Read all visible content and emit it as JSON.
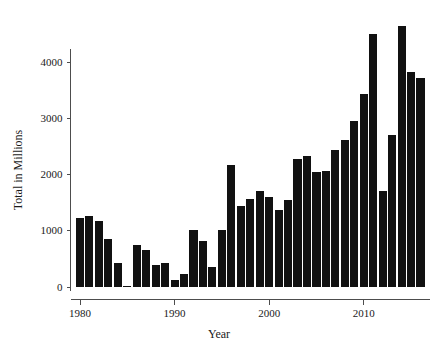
{
  "chart_data": {
    "type": "bar",
    "title": "",
    "xlabel": "Year",
    "ylabel": "Total in Millions",
    "categories": [
      1980,
      1981,
      1982,
      1983,
      1984,
      1985,
      1986,
      1987,
      1988,
      1989,
      1990,
      1991,
      1992,
      1993,
      1994,
      1995,
      1996,
      1997,
      1998,
      1999,
      2000,
      2001,
      2002,
      2003,
      2004,
      2005,
      2006,
      2007,
      2008,
      2009,
      2010,
      2011,
      2012,
      2013,
      2014,
      2015,
      2016
    ],
    "values": [
      1230,
      1265,
      1175,
      860,
      430,
      15,
      740,
      660,
      385,
      430,
      120,
      230,
      1020,
      810,
      360,
      1015,
      2165,
      1440,
      1560,
      1710,
      1600,
      1375,
      1545,
      2280,
      2335,
      2040,
      2060,
      2430,
      2610,
      2950,
      3430,
      4500,
      1710,
      2700,
      4640,
      3820,
      3720
    ],
    "xlim": [
      1979,
      2017
    ],
    "ylim": [
      0,
      4800
    ],
    "xticks": [
      1980,
      1990,
      2000,
      2010
    ],
    "xtick_labels": [
      "1980",
      "1990",
      "2000",
      "2010"
    ],
    "yticks": [
      0,
      1000,
      2000,
      3000,
      4000
    ],
    "ytick_labels": [
      "0",
      "1000",
      "2000",
      "3000",
      "4000"
    ],
    "grid": false,
    "legend": null,
    "bar_color": "#111111",
    "axis_color": "#4d4d4d",
    "background": "#ffffff"
  }
}
